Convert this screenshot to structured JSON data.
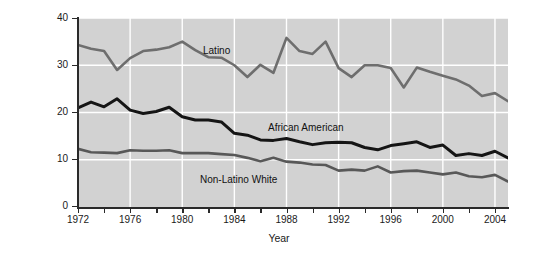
{
  "chart_data": {
    "type": "line",
    "title": "",
    "xlabel": "Year",
    "ylabel": "Percentage of 16- to 24-year-olds who\nhave dropped out of school",
    "xlim": [
      1972,
      2005
    ],
    "ylim": [
      0,
      40
    ],
    "yticks": [
      0,
      10,
      20,
      30,
      40
    ],
    "ytick_labels": [
      "0",
      "10",
      "20",
      "30",
      "40"
    ],
    "xticks": [
      1972,
      1974,
      1976,
      1978,
      1980,
      1982,
      1984,
      1986,
      1988,
      1990,
      1992,
      1994,
      1996,
      1998,
      2000,
      2002,
      2004
    ],
    "xtick_labels_shown": [
      "1972",
      "1976",
      "1980",
      "1984",
      "1988",
      "1992",
      "1996",
      "2000",
      "2004"
    ],
    "grid": true,
    "grid_color": "#ffffff",
    "plot_background": "#d2d2d2",
    "legend_position": "inline-annotations",
    "x": [
      1972,
      1973,
      1974,
      1975,
      1976,
      1977,
      1978,
      1979,
      1980,
      1981,
      1982,
      1983,
      1984,
      1985,
      1986,
      1987,
      1988,
      1989,
      1990,
      1991,
      1992,
      1993,
      1994,
      1995,
      1996,
      1997,
      1998,
      1999,
      2000,
      2001,
      2002,
      2003,
      2004,
      2005
    ],
    "series": [
      {
        "name": "Latino",
        "color": "#6e6e6e",
        "values": [
          34.3,
          33.5,
          33.0,
          29.0,
          31.5,
          33.0,
          33.3,
          33.8,
          35.0,
          33.2,
          31.7,
          31.6,
          30.0,
          27.5,
          30.1,
          28.4,
          35.8,
          33.0,
          32.4,
          35.0,
          29.4,
          27.5,
          30.0,
          30.0,
          29.4,
          25.3,
          29.5,
          28.6,
          27.8,
          27.0,
          25.7,
          23.5,
          24.1,
          22.4
        ]
      },
      {
        "name": "African American",
        "color": "#151515",
        "values": [
          21.0,
          22.2,
          21.2,
          22.9,
          20.5,
          19.8,
          20.2,
          21.1,
          19.1,
          18.4,
          18.4,
          18.0,
          15.6,
          15.2,
          14.2,
          14.1,
          14.5,
          13.8,
          13.2,
          13.6,
          13.7,
          13.6,
          12.6,
          12.1,
          13.0,
          13.4,
          13.8,
          12.6,
          13.1,
          10.9,
          11.3,
          10.9,
          11.8,
          10.4
        ]
      },
      {
        "name": "Non-Latino White",
        "color": "#585858",
        "values": [
          12.3,
          11.6,
          11.5,
          11.4,
          12.0,
          11.9,
          11.9,
          12.0,
          11.4,
          11.4,
          11.4,
          11.2,
          11.0,
          10.4,
          9.7,
          10.4,
          9.6,
          9.4,
          9.0,
          8.9,
          7.7,
          7.9,
          7.7,
          8.6,
          7.3,
          7.6,
          7.7,
          7.3,
          6.9,
          7.3,
          6.5,
          6.3,
          6.8,
          5.4
        ]
      }
    ],
    "annotations": [
      {
        "text": "Latino",
        "series": "Latino"
      },
      {
        "text": "African American",
        "series": "African American"
      },
      {
        "text": "Non-Latino White",
        "series": "Non-Latino White"
      }
    ]
  },
  "axes": {
    "y_title": "Percentage of 16- to 24-year-olds who\nhave dropped out of school",
    "x_title": "Year",
    "y_tick_labels": [
      "40",
      "30",
      "20",
      "10",
      "0"
    ],
    "x_tick_labels": [
      "1972",
      "1976",
      "1980",
      "1984",
      "1988",
      "1992",
      "1996",
      "2000",
      "2004"
    ]
  },
  "annotations": {
    "latino": "Latino",
    "african_american": "African American",
    "non_latino_white": "Non-Latino White"
  },
  "margin_bleed": ""
}
